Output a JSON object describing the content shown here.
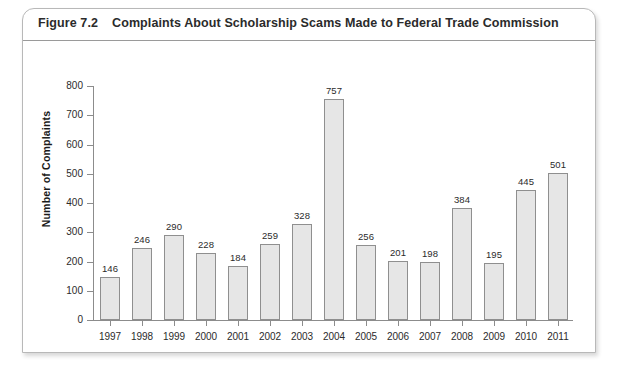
{
  "figure": {
    "number": "Figure 7.2",
    "title": "Complaints About Scholarship Scams Made to Federal Trade Commission"
  },
  "chart_data": {
    "type": "bar",
    "title": "Complaints About Scholarship Scams Made to Federal Trade Commission",
    "xlabel": "",
    "ylabel": "Number of Complaints",
    "categories": [
      "1997",
      "1998",
      "1999",
      "2000",
      "2001",
      "2002",
      "2003",
      "2004",
      "2005",
      "2006",
      "2007",
      "2008",
      "2009",
      "2010",
      "2011"
    ],
    "values": [
      146,
      246,
      290,
      228,
      184,
      259,
      328,
      757,
      256,
      201,
      198,
      384,
      195,
      445,
      501
    ],
    "ylim": [
      0,
      800
    ],
    "yticks": [
      0,
      100,
      200,
      300,
      400,
      500,
      600,
      700,
      800
    ],
    "ytick_labels": [
      "0",
      "100",
      "200",
      "300",
      "400",
      "500",
      "600",
      "700",
      "800"
    ],
    "grid": false,
    "legend": false,
    "data_labels": true,
    "bar_fill": "#e6e6e6",
    "bar_stroke": "#8f8f8f"
  }
}
